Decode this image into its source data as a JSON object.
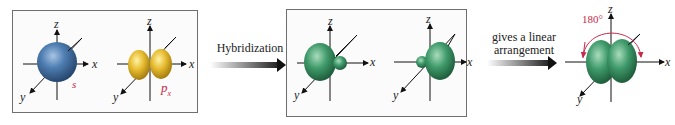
{
  "panels": [
    {
      "id": "unhybridized",
      "orbitals": [
        {
          "name": "s",
          "label": "s",
          "color": "#4a77a8",
          "shape": "sphere"
        },
        {
          "name": "px",
          "label": "p",
          "subscript": "x",
          "color": "#e3b62a",
          "shape": "dumbbell"
        }
      ]
    },
    {
      "id": "sp-hybrids",
      "orbitals": [
        {
          "name": "sp-left",
          "color": "#3f9a6a",
          "shape": "hybrid-left"
        },
        {
          "name": "sp-right",
          "color": "#3f9a6a",
          "shape": "hybrid-right"
        }
      ]
    },
    {
      "id": "linear",
      "orbitals": [
        {
          "name": "sp-pair",
          "color": "#3f9a6a",
          "shape": "linear-pair"
        }
      ],
      "angle_label": "180°"
    }
  ],
  "axes": {
    "x": "x",
    "y": "y",
    "z": "z"
  },
  "arrows": [
    {
      "text": "Hybridization"
    },
    {
      "line1": "gives a linear",
      "line2": "arrangement"
    }
  ],
  "colors": {
    "label_accent": "#c8284a",
    "angle_arc": "#c8284a",
    "frame": "#6e6e6e"
  }
}
